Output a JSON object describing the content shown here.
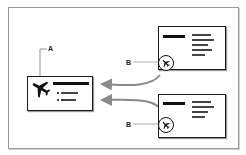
{
  "diagram": {
    "callouts": {
      "a": {
        "label": "A",
        "target": "main card airplane icon"
      },
      "b1": {
        "label": "B",
        "target": "top card airplane badge"
      },
      "b2": {
        "label": "B",
        "target": "bottom card airplane badge"
      }
    },
    "icons": {
      "main": "airplane-icon",
      "badge": "circled-airplane-icon"
    },
    "colors": {
      "ink": "#111111",
      "frame": "#9a9a9a",
      "arrow": "#8a8a8a",
      "leader": "#777777",
      "background": "#ffffff"
    }
  }
}
